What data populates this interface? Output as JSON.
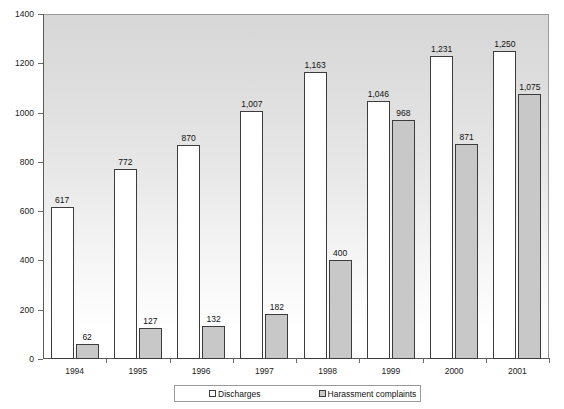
{
  "chart_data": {
    "type": "bar",
    "title": "",
    "subtitle": "",
    "xlabel": "",
    "ylabel": "",
    "categories": [
      "1994",
      "1995",
      "1996",
      "1997",
      "1998",
      "1999",
      "2000",
      "2001"
    ],
    "series": [
      {
        "name": "Discharges",
        "color": "#ffffff",
        "values": [
          617,
          772,
          870,
          1007,
          1163,
          1046,
          1231,
          1250
        ],
        "labels": [
          "617",
          "772",
          "870",
          "1,007",
          "1,163",
          "1,046",
          "1,231",
          "1,250"
        ]
      },
      {
        "name": "Harassment complaints",
        "color": "#c8c8c8",
        "values": [
          62,
          127,
          132,
          182,
          400,
          968,
          871,
          1075
        ],
        "labels": [
          "62",
          "127",
          "132",
          "182",
          "400",
          "968",
          "871",
          "1,075"
        ]
      }
    ],
    "ylim": [
      0,
      1400
    ],
    "yticks": [
      0,
      200,
      400,
      600,
      800,
      1000,
      1200,
      1400
    ],
    "ytick_labels": [
      "0",
      "200",
      "400",
      "600",
      "800",
      "1000",
      "1200",
      "1400"
    ],
    "grid": false,
    "legend_position": "bottom",
    "plot_background": "vertical gradient light-gray to white",
    "bar_border_color": "#3c3c3c",
    "axis_color": "#5a5a5a"
  },
  "legend": {
    "entries": [
      {
        "label": "Discharges"
      },
      {
        "label": "Harassment complaints"
      }
    ]
  }
}
